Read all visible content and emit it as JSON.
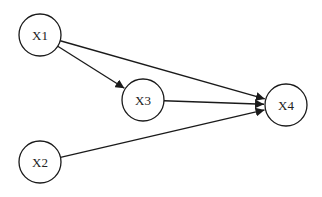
{
  "diagram": {
    "type": "directed-graph",
    "nodes": [
      {
        "id": "X1",
        "label": "X1",
        "cx": 40,
        "cy": 35,
        "r": 21
      },
      {
        "id": "X3",
        "label": "X3",
        "cx": 143,
        "cy": 100,
        "r": 21
      },
      {
        "id": "X4",
        "label": "X4",
        "cx": 286,
        "cy": 105,
        "r": 21
      },
      {
        "id": "X2",
        "label": "X2",
        "cx": 40,
        "cy": 162,
        "r": 21
      }
    ],
    "edges": [
      {
        "from": "X1",
        "to": "X3"
      },
      {
        "from": "X1",
        "to": "X4"
      },
      {
        "from": "X3",
        "to": "X4"
      },
      {
        "from": "X2",
        "to": "X4"
      }
    ],
    "colors": {
      "stroke": "#1a1a1a",
      "fill": "#ffffff",
      "background": "#ffffff"
    }
  }
}
